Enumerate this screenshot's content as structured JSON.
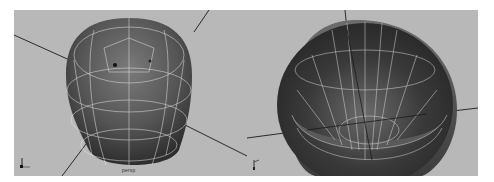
{
  "viewports": [
    {
      "id": "left",
      "camera_label": "persp",
      "view": "exterior-top",
      "colors": {
        "background": "#b8b8b8",
        "mesh_dark": "#3a3a3a",
        "mesh_mid": "#6a6a6a",
        "wire": "#e8e8e8",
        "grid": "#2a2a2a"
      }
    },
    {
      "id": "right",
      "camera_label": "",
      "view": "interior-top",
      "colors": {
        "background": "#b8b8b8",
        "mesh_dark": "#2e2e2e",
        "mesh_mid": "#5e5e5e",
        "wire": "#e0e0e0",
        "grid": "#2a2a2a"
      }
    }
  ]
}
